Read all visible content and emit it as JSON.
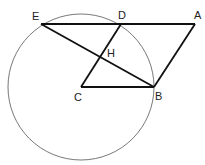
{
  "diagram": {
    "type": "geometry",
    "points": {
      "E": {
        "label": "E",
        "x": 41,
        "y": 24
      },
      "D": {
        "label": "D",
        "x": 121,
        "y": 24
      },
      "A": {
        "label": "A",
        "x": 195,
        "y": 24
      },
      "C": {
        "label": "C",
        "x": 81,
        "y": 87
      },
      "B": {
        "label": "B",
        "x": 154,
        "y": 87
      },
      "H": {
        "label": "H",
        "x": 100,
        "y": 57
      }
    },
    "circle": {
      "center": "C",
      "cx": 81,
      "cy": 87,
      "r": 73
    },
    "segments": [
      "EA",
      "AB",
      "BC",
      "CD",
      "EB"
    ],
    "colors": {
      "stroke": "#111111",
      "circle": "#555555"
    }
  }
}
